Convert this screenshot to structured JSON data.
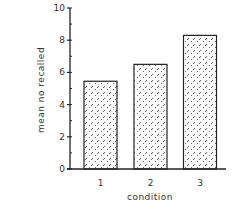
{
  "chart_data": {
    "type": "bar",
    "title": "",
    "xlabel": "condition",
    "ylabel": "mean no recalled",
    "categories": [
      "1",
      "2",
      "3"
    ],
    "values": [
      5.45,
      6.5,
      8.3
    ],
    "ylim": [
      0,
      10
    ],
    "yticks": [
      0,
      2,
      4,
      6,
      8,
      10
    ],
    "yticks_labels": [
      "0",
      "2",
      "4",
      "6",
      "8",
      "10"
    ],
    "minor_yticks_step": 1,
    "grid": false,
    "legend": null,
    "bar_fill": "diagonal-dash-hatch",
    "bar_edge_color": "#222222",
    "axis_color": "#222222"
  }
}
